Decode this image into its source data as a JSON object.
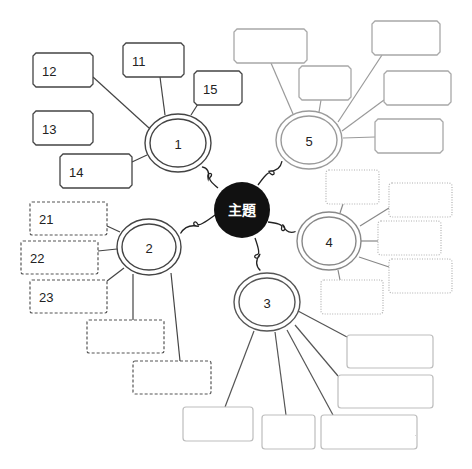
{
  "diagram": {
    "center": {
      "label": "主題",
      "x": 242,
      "y": 210,
      "r": 28,
      "color": "#111111"
    },
    "branches": [
      {
        "id": "1",
        "label": "1",
        "x": 178,
        "y": 143,
        "rx": 33,
        "ry": 29,
        "stroke": "#444444",
        "box_style": "solid-notched",
        "connector_from": [
          218,
          188
        ],
        "boxes": [
          {
            "label": "11",
            "x": 123,
            "y": 43,
            "w": 61,
            "h": 34,
            "anchor": [
              160,
              77
            ],
            "attach": [
              165,
              115
            ]
          },
          {
            "label": "12",
            "x": 33,
            "y": 53,
            "w": 60,
            "h": 34,
            "anchor": [
              93,
              77
            ],
            "attach": [
              149,
              128
            ]
          },
          {
            "label": "13",
            "x": 33,
            "y": 111,
            "w": 60,
            "h": 34,
            "anchor": null,
            "attach": null
          },
          {
            "label": "14",
            "x": 60,
            "y": 154,
            "w": 72,
            "h": 34,
            "anchor": [
              132,
              162
            ],
            "attach": [
              147,
              155
            ]
          },
          {
            "label": "15",
            "x": 194,
            "y": 71,
            "w": 48,
            "h": 34,
            "anchor": [
              198,
              104
            ],
            "attach": [
              191,
              115
            ]
          }
        ]
      },
      {
        "id": "5",
        "label": "5",
        "x": 309,
        "y": 140,
        "rx": 33,
        "ry": 29,
        "stroke": "#9a9a9a",
        "box_style": "solid-notched-light",
        "connector_from": [
          258,
          185
        ],
        "boxes": [
          {
            "label": "",
            "x": 234,
            "y": 29,
            "w": 73,
            "h": 34,
            "anchor": [
              271,
              63
            ],
            "attach": [
              293,
              114
            ]
          },
          {
            "label": "",
            "x": 299,
            "y": 66,
            "w": 52,
            "h": 34,
            "anchor": [
              321,
              100
            ],
            "attach": [
              319,
              112
            ]
          },
          {
            "label": "",
            "x": 372,
            "y": 21,
            "w": 68,
            "h": 34,
            "anchor": [
              382,
              55
            ],
            "attach": [
              338,
              122
            ]
          },
          {
            "label": "",
            "x": 384,
            "y": 71,
            "w": 67,
            "h": 34,
            "anchor": [
              384,
              100
            ],
            "attach": [
              342,
              131
            ]
          },
          {
            "label": "",
            "x": 375,
            "y": 119,
            "w": 68,
            "h": 34,
            "anchor": [
              375,
              137
            ],
            "attach": [
              343,
              138
            ]
          }
        ]
      },
      {
        "id": "2",
        "label": "2",
        "x": 149,
        "y": 247,
        "rx": 32,
        "ry": 28,
        "stroke": "#444444",
        "box_style": "dashed",
        "connector_from": [
          215,
          215
        ],
        "boxes": [
          {
            "label": "21",
            "x": 30,
            "y": 202,
            "w": 77,
            "h": 33,
            "anchor": [
              107,
              226
            ],
            "attach": [
              120,
              232
            ]
          },
          {
            "label": "22",
            "x": 21,
            "y": 241,
            "w": 77,
            "h": 33,
            "anchor": [
              98,
              251
            ],
            "attach": [
              117,
              249
            ]
          },
          {
            "label": "23",
            "x": 30,
            "y": 280,
            "w": 77,
            "h": 33,
            "anchor": [
              107,
              281
            ],
            "attach": [
              124,
              268
            ]
          },
          {
            "label": "",
            "x": 87,
            "y": 320,
            "w": 77,
            "h": 33,
            "anchor": [
              133,
              320
            ],
            "attach": [
              133,
              274
            ]
          },
          {
            "label": "",
            "x": 133,
            "y": 361,
            "w": 78,
            "h": 33,
            "anchor": [
              180,
              361
            ],
            "attach": [
              171,
              273
            ]
          }
        ]
      },
      {
        "id": "4",
        "label": "4",
        "x": 329,
        "y": 241,
        "rx": 32,
        "ry": 29,
        "stroke": "#888888",
        "box_style": "dotted",
        "connector_from": [
          268,
          222
        ],
        "boxes": [
          {
            "label": "",
            "x": 326,
            "y": 170,
            "w": 53,
            "h": 34,
            "anchor": [
              343,
              204
            ],
            "attach": [
              340,
              213
            ]
          },
          {
            "label": "",
            "x": 389,
            "y": 183,
            "w": 63,
            "h": 34,
            "anchor": [
              389,
              208
            ],
            "attach": [
              360,
              226
            ]
          },
          {
            "label": "",
            "x": 378,
            "y": 221,
            "w": 63,
            "h": 34,
            "anchor": [
              378,
              241
            ],
            "attach": [
              361,
              241
            ]
          },
          {
            "label": "",
            "x": 389,
            "y": 259,
            "w": 63,
            "h": 34,
            "anchor": [
              389,
              267
            ],
            "attach": [
              359,
              257
            ]
          },
          {
            "label": "",
            "x": 321,
            "y": 280,
            "w": 62,
            "h": 34,
            "anchor": [
              340,
              280
            ],
            "attach": [
              338,
              270
            ]
          }
        ]
      },
      {
        "id": "3",
        "label": "3",
        "x": 267,
        "y": 302,
        "rx": 33,
        "ry": 29,
        "stroke": "#555555",
        "box_style": "wavy",
        "connector_from": [
          255,
          238
        ],
        "boxes": [
          {
            "label": "",
            "x": 347,
            "y": 335,
            "w": 86,
            "h": 33,
            "anchor": [
              347,
              337
            ],
            "attach": [
              298,
              311
            ]
          },
          {
            "label": "",
            "x": 338,
            "y": 375,
            "w": 95,
            "h": 33,
            "anchor": [
              338,
              376
            ],
            "attach": [
              295,
              325
            ]
          },
          {
            "label": "",
            "x": 321,
            "y": 415,
            "w": 96,
            "h": 34,
            "anchor": [
              333,
              415
            ],
            "attach": [
              287,
              330
            ]
          },
          {
            "label": "",
            "x": 262,
            "y": 415,
            "w": 53,
            "h": 34,
            "anchor": [
              286,
              415
            ],
            "attach": [
              275,
              332
            ]
          },
          {
            "label": "",
            "x": 183,
            "y": 407,
            "w": 70,
            "h": 34,
            "anchor": [
              225,
              407
            ],
            "attach": [
              254,
              331
            ]
          }
        ]
      }
    ]
  }
}
